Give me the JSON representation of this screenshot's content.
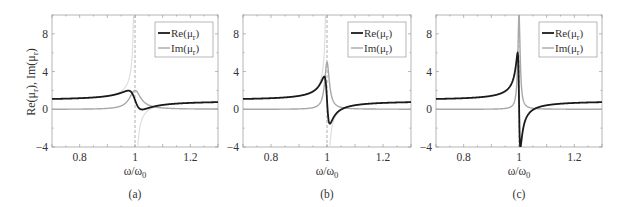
{
  "figure": {
    "ylabel": "Re(μ_r), Im(μ_r)",
    "panels_count": 3
  },
  "chart_data": [
    {
      "type": "line",
      "panel_label": "(a)",
      "xlabel": "ω/ω_0",
      "ylabel": "Re(μ_r), Im(μ_r)",
      "xlim": [
        0.7,
        1.3
      ],
      "ylim": [
        -4,
        10
      ],
      "xticks": [
        0.8,
        1,
        1.2
      ],
      "xtick_labels": [
        "0.8",
        "1",
        "1.2"
      ],
      "yticks": [
        -4,
        0,
        4,
        8
      ],
      "ytick_labels": [
        "−4",
        "0",
        "4",
        "8"
      ],
      "legend": [
        "Re(μ_r)",
        "Im(μ_r)"
      ],
      "legend_position": "upper right",
      "grid": false,
      "resonance_marker_x": 1.0,
      "model": {
        "F": 0.1,
        "gamma": 0.05
      },
      "x": [
        0.7,
        0.8,
        0.9,
        0.95,
        0.975,
        1.0,
        1.02,
        1.05,
        1.1,
        1.2,
        1.3
      ],
      "series": [
        {
          "name": "Re(μ_r)",
          "color": "#1a1a1a",
          "values": [
            1.09,
            1.17,
            1.38,
            1.72,
            1.99,
            1.0,
            0.02,
            0.08,
            0.42,
            0.63,
            0.75
          ]
        },
        {
          "name": "Im(μ_r)",
          "color": "#a8a8a8",
          "values": [
            0.0,
            0.01,
            0.04,
            0.19,
            0.86,
            2.0,
            1.7,
            0.33,
            0.07,
            0.02,
            0.01
          ]
        },
        {
          "name": "Re(μ_r) lossless",
          "color": "#dcdcdc",
          "values": [
            1.1,
            1.18,
            1.43,
            1.93,
            2.93,
            null,
            -1.6,
            -0.1,
            0.42,
            0.65,
            0.76
          ]
        }
      ]
    },
    {
      "type": "line",
      "panel_label": "(b)",
      "xlabel": "ω/ω_0",
      "ylabel": "",
      "xlim": [
        0.7,
        1.3
      ],
      "ylim": [
        -4,
        10
      ],
      "xticks": [
        0.8,
        1,
        1.2
      ],
      "xtick_labels": [
        "0.8",
        "1",
        "1.2"
      ],
      "yticks": [
        -4,
        0,
        4,
        8
      ],
      "ytick_labels": [
        "−4",
        "0",
        "4",
        "8"
      ],
      "legend": [
        "Re(μ_r)",
        "Im(μ_r)"
      ],
      "legend_position": "upper right",
      "grid": false,
      "resonance_marker_x": 1.0,
      "model": {
        "F": 0.1,
        "gamma": 0.02
      },
      "x": [
        0.7,
        0.8,
        0.9,
        0.95,
        0.99,
        1.0,
        1.01,
        1.05,
        1.1,
        1.2,
        1.3
      ],
      "series": [
        {
          "name": "Re(μ_r)",
          "color": "#1a1a1a",
          "values": [
            1.1,
            1.18,
            1.42,
            1.9,
            3.5,
            1.0,
            -1.5,
            -0.08,
            0.42,
            0.64,
            0.75
          ]
        },
        {
          "name": "Im(μ_r)",
          "color": "#a8a8a8",
          "values": [
            0.0,
            0.0,
            0.02,
            0.04,
            2.5,
            5.0,
            2.5,
            0.04,
            0.01,
            0.0,
            0.0
          ]
        },
        {
          "name": "Re(μ_r) lossless",
          "color": "#dcdcdc",
          "values": [
            1.1,
            1.18,
            1.43,
            1.93,
            5.9,
            null,
            -4.0,
            -0.1,
            0.42,
            0.65,
            0.76
          ]
        }
      ]
    },
    {
      "type": "line",
      "panel_label": "(c)",
      "xlabel": "ω/ω_0",
      "ylabel": "",
      "xlim": [
        0.7,
        1.3
      ],
      "ylim": [
        -4,
        10
      ],
      "xticks": [
        0.8,
        1,
        1.2
      ],
      "xtick_labels": [
        "0.8",
        "1",
        "1.2"
      ],
      "yticks": [
        -4,
        0,
        4,
        8
      ],
      "ytick_labels": [
        "−4",
        "0",
        "4",
        "8"
      ],
      "legend": [
        "Re(μ_r)",
        "Im(μ_r)"
      ],
      "legend_position": "upper right",
      "grid": false,
      "resonance_marker_x": 1.0,
      "model": {
        "F": 0.1,
        "gamma": 0.01
      },
      "x": [
        0.7,
        0.8,
        0.9,
        0.95,
        0.995,
        1.0,
        1.005,
        1.05,
        1.1,
        1.2,
        1.3
      ],
      "series": [
        {
          "name": "Re(μ_r)",
          "color": "#1a1a1a",
          "values": [
            1.1,
            1.18,
            1.43,
            1.93,
            6.0,
            1.0,
            -4.0,
            -0.1,
            0.42,
            0.65,
            0.76
          ]
        },
        {
          "name": "Im(μ_r)",
          "color": "#a8a8a8",
          "values": [
            0.0,
            0.0,
            0.01,
            0.02,
            5.0,
            10.0,
            5.0,
            0.02,
            0.0,
            0.0,
            0.0
          ]
        }
      ]
    }
  ],
  "panels": [
    {
      "id": "a",
      "caption": "(a)",
      "box": {
        "x": 52,
        "y": 15,
        "w": 166,
        "h": 132
      }
    },
    {
      "id": "b",
      "caption": "(b)",
      "box": {
        "x": 243,
        "y": 15,
        "w": 168,
        "h": 132
      }
    },
    {
      "id": "c",
      "caption": "(c)",
      "box": {
        "x": 436,
        "y": 15,
        "w": 166,
        "h": 132
      }
    }
  ]
}
